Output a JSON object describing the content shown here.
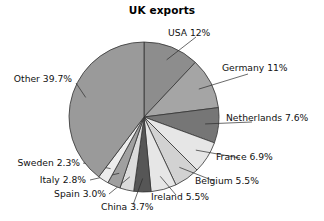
{
  "chart": {
    "title": "UK exports"
  },
  "chart_data": {
    "type": "pie",
    "title": "UK exports",
    "subtitle": "",
    "xlabel": "",
    "ylabel": "",
    "legend": "none (direct labels with leader lines)",
    "grid": false,
    "units": "percent",
    "start_angle_deg": 0,
    "direction": "clockwise",
    "categories": [
      "USA",
      "Germany",
      "Netherlands",
      "France",
      "Belgium",
      "Ireland",
      "China",
      "Spain",
      "Italy",
      "Sweden",
      "Other"
    ],
    "values": [
      12,
      11,
      7.6,
      6.9,
      5.5,
      5.5,
      3.7,
      3.0,
      2.8,
      2.3,
      39.7
    ],
    "labels": [
      "USA 12%",
      "Germany 11%",
      "Netherlands 7.6%",
      "France 6.9%",
      "Belgium 5.5%",
      "Ireland 5.5%",
      "China 3.7%",
      "Spain 3.0%",
      "Italy 2.8%",
      "Sweden 2.3%",
      "Other 39.7%"
    ],
    "slice_colors": [
      "#8d8d8d",
      "#a5a5a5",
      "#767676",
      "#e6e6e6",
      "#d2d2d2",
      "#e6e6e6",
      "#565656",
      "#dcdcdc",
      "#a0a0a0",
      "#ededed",
      "#9a9a9a"
    ],
    "slice_edge_color": "#333333",
    "background_color": "#ffffff",
    "text_color": "#111111"
  }
}
